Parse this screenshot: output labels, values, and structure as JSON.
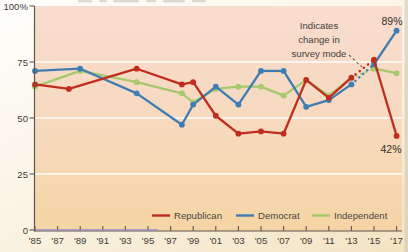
{
  "chart_data": {
    "type": "line",
    "title": "",
    "xlabel": "",
    "ylabel": "",
    "ylim": [
      0,
      100
    ],
    "xlim": [
      1985,
      2017
    ],
    "grid": "horizontal-white-25-50-75",
    "legend_position": "bottom-inside",
    "x_tick_years": [
      1985,
      1987,
      1989,
      1991,
      1993,
      1995,
      1997,
      1999,
      2001,
      2003,
      2005,
      2007,
      2009,
      2011,
      2013,
      2015,
      2017
    ],
    "x_tick_labels": [
      "'85",
      "'87",
      "'89",
      "'91",
      "'93",
      "'95",
      "'97",
      "'99",
      "'01",
      "'03",
      "'05",
      "'07",
      "'09",
      "'11",
      "'13",
      "'15",
      "'17"
    ],
    "y_tick_values": [
      100,
      75,
      50,
      25,
      0
    ],
    "y_tick_labels": [
      "100%",
      "75",
      "50",
      "25",
      "0"
    ],
    "mode_change_gap": [
      2013,
      2015
    ],
    "annotation_text": "Indicates change in survey mode",
    "end_labels": [
      {
        "series": "Democrat",
        "text": "89%"
      },
      {
        "series": "Republican",
        "text": "42%"
      }
    ],
    "series": [
      {
        "name": "Republican",
        "color": "#bf2d1f",
        "points": [
          [
            1985,
            65
          ],
          [
            1988,
            63
          ],
          [
            1994,
            72
          ],
          [
            1998,
            65
          ],
          [
            1999,
            66
          ],
          [
            2001,
            51
          ],
          [
            2003,
            43
          ],
          [
            2005,
            44
          ],
          [
            2007,
            43
          ],
          [
            2009,
            67
          ],
          [
            2011,
            59
          ],
          [
            2013,
            68
          ],
          [
            2015,
            76
          ],
          [
            2017,
            42
          ]
        ]
      },
      {
        "name": "Democrat",
        "color": "#3e7db3",
        "points": [
          [
            1985,
            71
          ],
          [
            1989,
            72
          ],
          [
            1994,
            61
          ],
          [
            1998,
            47
          ],
          [
            1999,
            56
          ],
          [
            2001,
            64
          ],
          [
            2003,
            56
          ],
          [
            2005,
            71
          ],
          [
            2007,
            71
          ],
          [
            2009,
            55
          ],
          [
            2011,
            58
          ],
          [
            2013,
            65
          ],
          [
            2015,
            74
          ],
          [
            2017,
            89
          ]
        ]
      },
      {
        "name": "Independent",
        "color": "#a5c96b",
        "points": [
          [
            1985,
            64
          ],
          [
            1989,
            71
          ],
          [
            1994,
            66
          ],
          [
            1998,
            61
          ],
          [
            1999,
            57
          ],
          [
            2001,
            63
          ],
          [
            2003,
            64
          ],
          [
            2005,
            64
          ],
          [
            2007,
            60
          ],
          [
            2009,
            67
          ],
          [
            2011,
            60
          ],
          [
            2013,
            68
          ],
          [
            2015,
            72
          ],
          [
            2017,
            70
          ]
        ]
      }
    ]
  },
  "legend": {
    "items": [
      {
        "label": "Republican",
        "color": "#bf2d1f"
      },
      {
        "label": "Democrat",
        "color": "#3e7db3"
      },
      {
        "label": "Independent",
        "color": "#a5c96b"
      }
    ]
  },
  "annotation": {
    "line1": "Indicates",
    "line2": "change in",
    "line3": "survey mode"
  },
  "end_labels": {
    "democrat": "89%",
    "republican": "42%"
  },
  "colors": {
    "plot_bg_top": "#f8dccf",
    "plot_bg_bottom": "#f5d5a4",
    "gridline": "#ffffff",
    "axis": "#5f574d",
    "tick_text": "#3f3b36",
    "annotation_arrow": "#6b6560",
    "axis_scan_artifact": "#9d8ed2"
  }
}
